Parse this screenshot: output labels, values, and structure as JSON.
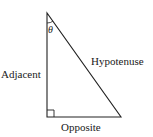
{
  "diagram": {
    "type": "right-triangle",
    "angle_label": "θ",
    "labels": {
      "adjacent": "Adjacent",
      "hypotenuse": "Hypotenuse",
      "opposite": "Opposite"
    },
    "vertices": {
      "top": [
        47,
        13
      ],
      "bottom_left": [
        47,
        117
      ],
      "bottom_right": [
        121,
        117
      ]
    },
    "stroke_color": "#222222"
  }
}
